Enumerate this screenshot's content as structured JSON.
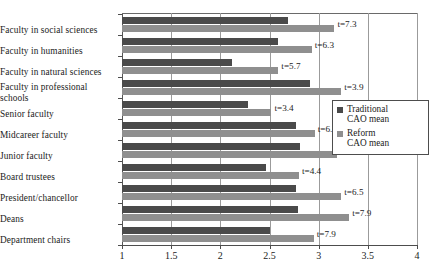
{
  "chart_data": {
    "type": "bar",
    "orientation": "horizontal",
    "title": "",
    "xlabel": "",
    "ylabel": "",
    "xlim": [
      1,
      4
    ],
    "xticks": [
      1,
      1.5,
      2,
      2.5,
      3,
      3.5,
      4
    ],
    "xticklabels": [
      "1",
      "1.5",
      "2",
      "2.5",
      "3",
      "3.5",
      "4"
    ],
    "grid": true,
    "grid_axis": "x",
    "legend_position": "center right",
    "categories": [
      "Faculty in social sciences",
      "Faculty in humanities",
      "Faculty in natural sciences",
      "Faculty in professional\nschools",
      "Senior faculty",
      "Midcareer faculty",
      "Junior faculty",
      "Board trustees",
      "President/chancellor",
      "Deans",
      "Department chairs"
    ],
    "series": [
      {
        "name": "Traditional CAO mean",
        "color": "#4a4a4a",
        "values": [
          2.69,
          2.59,
          2.12,
          2.91,
          2.28,
          2.77,
          2.81,
          2.46,
          2.77,
          2.79,
          2.51
        ]
      },
      {
        "name": "Reform CAO mean",
        "color": "#8f8f8f",
        "values": [
          3.16,
          2.93,
          2.59,
          3.23,
          2.52,
          2.96,
          3.19,
          2.8,
          3.23,
          3.31,
          2.95
        ]
      }
    ],
    "annotations": [
      "t=7.3",
      "t=6.3",
      "t=5.7",
      "t=3.9",
      "t=3.4",
      "t=6.5",
      "t=5.8",
      "t=4.4",
      "t=6.5",
      "t=7.9",
      "t=7.9"
    ]
  },
  "legend": {
    "items": [
      {
        "label": "Traditional\nCAO mean",
        "color": "#4a4a4a"
      },
      {
        "label": "Reform\nCAO mean",
        "color": "#8f8f8f"
      }
    ]
  }
}
